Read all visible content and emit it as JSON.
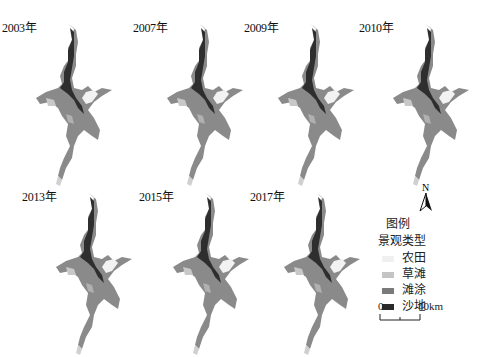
{
  "figure": {
    "panels": [
      {
        "year_label": "2003年",
        "x": 2,
        "y": 18
      },
      {
        "year_label": "2007年",
        "x": 133,
        "y": 18
      },
      {
        "year_label": "2009年",
        "x": 244,
        "y": 18
      },
      {
        "year_label": "2010年",
        "x": 359,
        "y": 18
      },
      {
        "year_label": "2013年",
        "x": 22,
        "y": 187
      },
      {
        "year_label": "2015年",
        "x": 139,
        "y": 187
      },
      {
        "year_label": "2017年",
        "x": 250,
        "y": 187
      }
    ],
    "north_arrow": {
      "label": "N"
    },
    "legend": {
      "title": "图例",
      "subtitle": "景观类型",
      "items": [
        {
          "label": "农田",
          "color": "#f0f0f0"
        },
        {
          "label": "草滩",
          "color": "#c4c4c4"
        },
        {
          "label": "滩涂",
          "color": "#7a7a7a"
        },
        {
          "label": "沙地",
          "color": "#2a2a2a"
        }
      ]
    },
    "scale_bar": {
      "start": "0",
      "end": "40km"
    }
  }
}
